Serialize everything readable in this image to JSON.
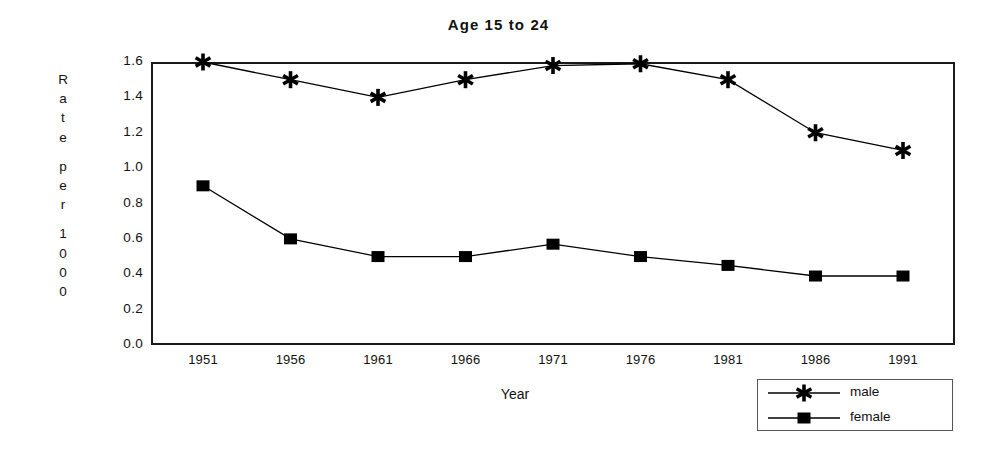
{
  "chart_data": {
    "type": "line",
    "title": "Age 15 to 24",
    "xlabel": "Year",
    "ylabel": "Rate per 1000",
    "ylabel_chars": [
      "R",
      "a",
      "t",
      "e",
      "",
      "p",
      "e",
      "r",
      "",
      "1",
      "0",
      "0",
      "0"
    ],
    "categories": [
      1951,
      1956,
      1961,
      1966,
      1971,
      1976,
      1981,
      1986,
      1991
    ],
    "xtick_labels": [
      "1951",
      "1956",
      "1961",
      "1966",
      "1971",
      "1976",
      "1981",
      "1986",
      "1991"
    ],
    "ytick_labels": [
      "0.0",
      "0.2",
      "0.4",
      "0.6",
      "0.8",
      "1.0",
      "1.2",
      "1.4",
      "1.6"
    ],
    "ytick_values": [
      0.0,
      0.2,
      0.4,
      0.6,
      0.8,
      1.0,
      1.2,
      1.4,
      1.6
    ],
    "ylim": [
      0.0,
      1.6
    ],
    "xlim": [
      1951,
      1991
    ],
    "grid": false,
    "legend_position": "bottom-right-outside",
    "series": [
      {
        "name": "male",
        "marker": "asterisk",
        "color": "#000000",
        "values": [
          1.6,
          1.5,
          1.4,
          1.5,
          1.58,
          1.59,
          1.5,
          1.2,
          1.1
        ]
      },
      {
        "name": "female",
        "marker": "filled-square",
        "color": "#000000",
        "values": [
          0.9,
          0.6,
          0.5,
          0.5,
          0.57,
          0.5,
          0.45,
          0.39,
          0.39
        ]
      }
    ]
  },
  "legend": {
    "entries": [
      {
        "label": "male"
      },
      {
        "label": "female"
      }
    ]
  },
  "colors": {
    "frame": "#1a1a1a",
    "series": "#000000",
    "background": "#ffffff",
    "text": "#111111"
  }
}
